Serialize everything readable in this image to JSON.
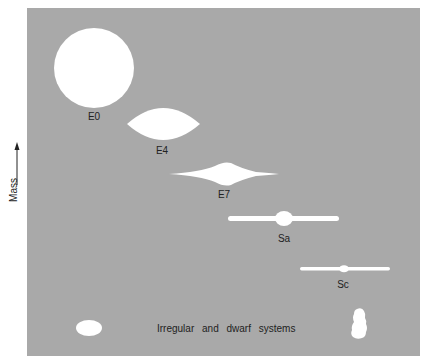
{
  "diagram": {
    "title": "",
    "axis": {
      "label": "Mass",
      "direction": "up"
    },
    "colors": {
      "background": "#a9a9a9",
      "shape": "#ffffff",
      "text": "#222222"
    },
    "galaxies": [
      {
        "id": "E0",
        "label": "E0",
        "shape": "circle"
      },
      {
        "id": "E4",
        "label": "E4",
        "shape": "lens"
      },
      {
        "id": "E7",
        "label": "E7",
        "shape": "flattened-spindle"
      },
      {
        "id": "Sa",
        "label": "Sa",
        "shape": "disk-with-bulge"
      },
      {
        "id": "Sc",
        "label": "Sc",
        "shape": "thin-disk-small-bulge"
      }
    ],
    "irregular": {
      "caption": "Irregular and dwarf systems"
    }
  }
}
